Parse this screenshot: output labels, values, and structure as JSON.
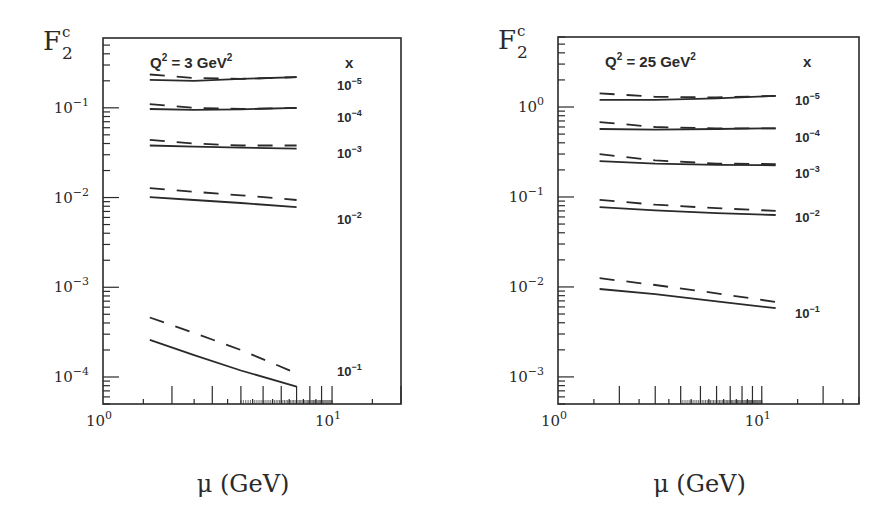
{
  "figure": {
    "xlabel": "μ (GeV)",
    "ylabel_main": "F",
    "ylabel_sub": "2",
    "ylabel_sup": "c",
    "legend_header": "x",
    "line_styles": {
      "solid": "solid",
      "dashed": "dashed"
    }
  },
  "chart_data": [
    {
      "type": "line",
      "title": "Q² = 3 GeV²",
      "title_parts": {
        "q": "Q",
        "q_exp": "2",
        "eq": " = 3 GeV",
        "unit_exp": "2"
      },
      "xlabel": "μ (GeV)",
      "ylabel": "F2^c",
      "xscale": "log",
      "yscale": "log",
      "xlim": [
        1,
        20
      ],
      "ylim": [
        5e-05,
        0.6
      ],
      "xticks": [
        {
          "value": 1,
          "base": "10",
          "exp": "0"
        },
        {
          "value": 10,
          "base": "10",
          "exp": "1"
        }
      ],
      "yticks": [
        {
          "value": 0.1,
          "base": "10",
          "exp": "−1"
        },
        {
          "value": 0.01,
          "base": "10",
          "exp": "−2"
        },
        {
          "value": 0.001,
          "base": "10",
          "exp": "−3"
        },
        {
          "value": 0.0001,
          "base": "10",
          "exp": "−4"
        }
      ],
      "frame": {
        "left": 103,
        "top": 38,
        "right": 401,
        "bottom": 404
      },
      "series": [
        {
          "name": "x = 1e-5 solid",
          "x_label": {
            "base": "10",
            "exp": "−5",
            "y": 84
          },
          "style": "solid",
          "x": [
            1.6,
            2.5,
            4,
            7
          ],
          "values": [
            0.205,
            0.2,
            0.21,
            0.22
          ]
        },
        {
          "name": "x = 1e-5 dashed",
          "style": "dashed",
          "x": [
            1.6,
            2.5,
            4,
            7
          ],
          "values": [
            0.235,
            0.215,
            0.21,
            0.22
          ]
        },
        {
          "name": "x = 1e-4 solid",
          "x_label": {
            "base": "10",
            "exp": "−4",
            "y": 116
          },
          "style": "solid",
          "x": [
            1.6,
            2.5,
            4,
            7
          ],
          "values": [
            0.097,
            0.095,
            0.096,
            0.1
          ]
        },
        {
          "name": "x = 1e-4 dashed",
          "style": "dashed",
          "x": [
            1.6,
            2.5,
            4,
            7
          ],
          "values": [
            0.11,
            0.1,
            0.097,
            0.1
          ]
        },
        {
          "name": "x = 1e-3 solid",
          "x_label": {
            "base": "10",
            "exp": "−3",
            "y": 152
          },
          "style": "solid",
          "x": [
            1.6,
            2.5,
            4,
            7
          ],
          "values": [
            0.038,
            0.037,
            0.036,
            0.035
          ]
        },
        {
          "name": "x = 1e-3 dashed",
          "style": "dashed",
          "x": [
            1.6,
            2.5,
            4,
            7
          ],
          "values": [
            0.044,
            0.04,
            0.038,
            0.038
          ]
        },
        {
          "name": "x = 1e-2 solid",
          "x_label": {
            "base": "10",
            "exp": "−2",
            "y": 218
          },
          "style": "solid",
          "x": [
            1.6,
            2.5,
            4,
            7
          ],
          "values": [
            0.0101,
            0.0094,
            0.0087,
            0.0078
          ]
        },
        {
          "name": "x = 1e-2 dashed",
          "style": "dashed",
          "x": [
            1.6,
            2.5,
            4,
            7
          ],
          "values": [
            0.0127,
            0.0116,
            0.0106,
            0.0094
          ]
        },
        {
          "name": "x = 1e-1 solid",
          "x_label": {
            "base": "10",
            "exp": "−1",
            "y": 370
          },
          "style": "solid",
          "x": [
            1.6,
            2.5,
            4,
            7
          ],
          "values": [
            0.00026,
            0.000175,
            0.000118,
            7.8e-05
          ]
        },
        {
          "name": "x = 1e-1 dashed",
          "style": "dashed",
          "x": [
            1.6,
            2.5,
            4,
            7
          ],
          "values": [
            0.00046,
            0.00031,
            0.0002,
            0.00011
          ]
        }
      ]
    },
    {
      "type": "line",
      "title": "Q² = 25 GeV²",
      "title_parts": {
        "q": "Q",
        "q_exp": "2",
        "eq": " = 25 GeV",
        "unit_exp": "2"
      },
      "xlabel": "μ (GeV)",
      "ylabel": "F2^c",
      "xscale": "log",
      "yscale": "log",
      "xlim": [
        1,
        30
      ],
      "ylim": [
        0.0005,
        6
      ],
      "xticks": [
        {
          "value": 1,
          "base": "10",
          "exp": "0"
        },
        {
          "value": 10,
          "base": "10",
          "exp": "1"
        }
      ],
      "yticks": [
        {
          "value": 1,
          "base": "10",
          "exp": "0"
        },
        {
          "value": 0.1,
          "base": "10",
          "exp": "−1"
        },
        {
          "value": 0.01,
          "base": "10",
          "exp": "−2"
        },
        {
          "value": 0.001,
          "base": "10",
          "exp": "−3"
        }
      ],
      "frame": {
        "left": 558,
        "top": 37,
        "right": 859,
        "bottom": 404
      },
      "series": [
        {
          "name": "x = 1e-5 solid",
          "x_label": {
            "base": "10",
            "exp": "−5",
            "y": 99
          },
          "style": "solid",
          "x": [
            1.6,
            3,
            6,
            11.7
          ],
          "values": [
            1.2,
            1.2,
            1.25,
            1.33
          ]
        },
        {
          "name": "x = 1e-5 dashed",
          "style": "dashed",
          "x": [
            1.6,
            3,
            6,
            11.7
          ],
          "values": [
            1.42,
            1.3,
            1.28,
            1.33
          ]
        },
        {
          "name": "x = 1e-4 solid",
          "x_label": {
            "base": "10",
            "exp": "−4",
            "y": 136
          },
          "style": "solid",
          "x": [
            1.6,
            3,
            6,
            11.7
          ],
          "values": [
            0.57,
            0.56,
            0.57,
            0.58
          ]
        },
        {
          "name": "x = 1e-4 dashed",
          "style": "dashed",
          "x": [
            1.6,
            3,
            6,
            11.7
          ],
          "values": [
            0.68,
            0.6,
            0.58,
            0.58
          ]
        },
        {
          "name": "x = 1e-3 solid",
          "x_label": {
            "base": "10",
            "exp": "−3",
            "y": 172
          },
          "style": "solid",
          "x": [
            1.6,
            3,
            6,
            11.7
          ],
          "values": [
            0.25,
            0.235,
            0.228,
            0.225
          ]
        },
        {
          "name": "x = 1e-3 dashed",
          "style": "dashed",
          "x": [
            1.6,
            3,
            6,
            11.7
          ],
          "values": [
            0.3,
            0.255,
            0.235,
            0.232
          ]
        },
        {
          "name": "x = 1e-2 solid",
          "x_label": {
            "base": "10",
            "exp": "−2",
            "y": 216
          },
          "style": "solid",
          "x": [
            1.6,
            3,
            6,
            11.7
          ],
          "values": [
            0.077,
            0.071,
            0.066,
            0.063
          ]
        },
        {
          "name": "x = 1e-2 dashed",
          "style": "dashed",
          "x": [
            1.6,
            3,
            6,
            11.7
          ],
          "values": [
            0.093,
            0.082,
            0.075,
            0.07
          ]
        },
        {
          "name": "x = 1e-1 solid",
          "x_label": {
            "base": "10",
            "exp": "−1",
            "y": 312
          },
          "style": "solid",
          "x": [
            1.6,
            3,
            6,
            11.7
          ],
          "values": [
            0.0095,
            0.0083,
            0.0069,
            0.0058
          ]
        },
        {
          "name": "x = 1e-1 dashed",
          "style": "dashed",
          "x": [
            1.6,
            3,
            6,
            11.7
          ],
          "values": [
            0.0125,
            0.0105,
            0.0085,
            0.0068
          ]
        }
      ]
    }
  ]
}
